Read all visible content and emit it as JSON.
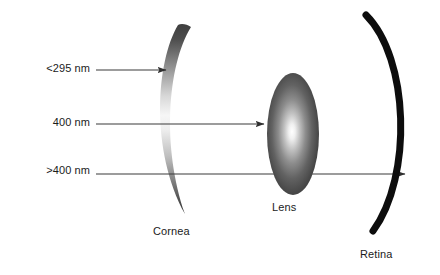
{
  "figure": {
    "background_color": "#ffffff",
    "width": 440,
    "height": 275
  },
  "rays": [
    {
      "id": "ray-uvc",
      "label": "<295 nm",
      "label_x": 8,
      "label_y": 62,
      "y": 70,
      "start_x": 96,
      "end_x": 166,
      "blocked_by": "cornea",
      "color": "#3b3b3b"
    },
    {
      "id": "ray-400",
      "label": "400 nm",
      "label_x": 8,
      "label_y": 116,
      "y": 124,
      "start_x": 96,
      "end_x": 264,
      "blocked_by": "lens",
      "color": "#3b3b3b"
    },
    {
      "id": "ray-visible",
      "label": ">400 nm",
      "label_x": 8,
      "label_y": 164,
      "y": 174,
      "start_x": 96,
      "end_x": 405,
      "blocked_by": "retina",
      "color": "#3b3b3b"
    }
  ],
  "structures": [
    {
      "id": "cornea",
      "label": "Cornea",
      "label_x": 153,
      "label_y": 225,
      "shape": "crescent",
      "gradient": [
        "#4a4a4a",
        "#f2f2f2",
        "#4a4a4a"
      ],
      "center_x": 172,
      "top_y": 25,
      "bottom_y": 214
    },
    {
      "id": "lens",
      "label": "Lens",
      "label_x": 272,
      "label_y": 201,
      "shape": "ellipse",
      "gradient_center": "#ffffff",
      "gradient_edge": "#3c3c3c",
      "center_x": 293,
      "center_y": 134,
      "radius_x": 26,
      "radius_y": 61
    },
    {
      "id": "retina",
      "label": "Retina",
      "label_x": 360,
      "label_y": 248,
      "shape": "arc",
      "color": "#0d0d0d",
      "top_x": 366,
      "top_y": 15,
      "bottom_x": 373,
      "bottom_y": 231,
      "bulge_x": 413,
      "stroke_width": 7
    }
  ],
  "colors": {
    "background": "#ffffff",
    "text": "#1b1b1b",
    "ray": "#3b3b3b",
    "retina": "#0d0d0d"
  }
}
